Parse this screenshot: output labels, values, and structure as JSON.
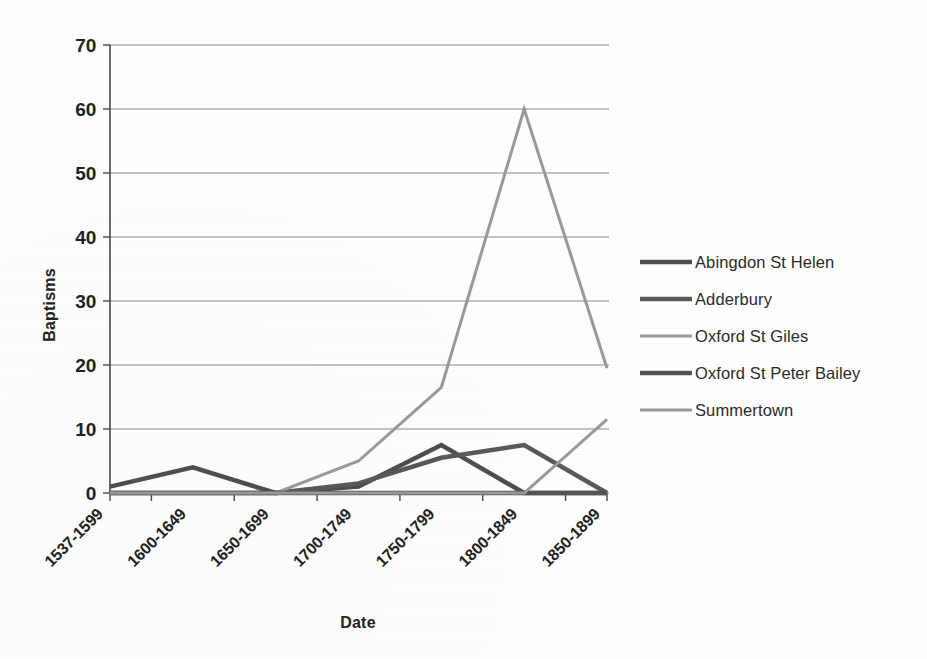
{
  "chart_data": {
    "type": "line",
    "title": "",
    "xlabel": "Date",
    "ylabel": "Baptisms",
    "categories": [
      "1537-1599",
      "1600-1649",
      "1650-1699",
      "1700-1749",
      "1750-1799",
      "1800-1849",
      "1850-1899"
    ],
    "ylim": [
      0,
      70
    ],
    "yticks": [
      0,
      10,
      20,
      30,
      40,
      50,
      60,
      70
    ],
    "grid": true,
    "legend_position": "right",
    "series": [
      {
        "name": "Abingdon St Helen",
        "color": "#4f4f4f",
        "values": [
          1,
          4,
          0,
          1,
          7.5,
          0,
          0
        ]
      },
      {
        "name": "Adderbury",
        "color": "#5a5a5a",
        "values": [
          0,
          0,
          0,
          1.5,
          5.5,
          7.5,
          0
        ]
      },
      {
        "name": "Oxford St Giles",
        "color": "#9a9a9a",
        "values": [
          0,
          0,
          0,
          5,
          16.5,
          60,
          19.5
        ]
      },
      {
        "name": "Oxford St Peter Bailey",
        "color": "#555555",
        "values": [
          0,
          0,
          0,
          0,
          0,
          0,
          0
        ]
      },
      {
        "name": "Summertown",
        "color": "#9a9a9a",
        "values": [
          0,
          0,
          0,
          0,
          0,
          0,
          11.5
        ]
      }
    ]
  },
  "axes": {
    "y_title": "Baptisms",
    "x_title": "Date",
    "y_tick_labels": [
      "70",
      "60",
      "50",
      "40",
      "30",
      "20",
      "10",
      "0"
    ],
    "x_tick_labels": [
      "1537-1599",
      "1600-1649",
      "1650-1699",
      "1700-1749",
      "1750-1799",
      "1800-1849",
      "1850-1899"
    ]
  },
  "legend": {
    "items": [
      {
        "label": "Abingdon St Helen",
        "color": "#4f4f4f",
        "width": 4.5
      },
      {
        "label": "Adderbury",
        "color": "#5a5a5a",
        "width": 4.5
      },
      {
        "label": "Oxford St Giles",
        "color": "#9a9a9a",
        "width": 3.0
      },
      {
        "label": "Oxford St Peter Bailey",
        "color": "#555555",
        "width": 4.5
      },
      {
        "label": "Summertown",
        "color": "#9a9a9a",
        "width": 3.0
      }
    ]
  }
}
